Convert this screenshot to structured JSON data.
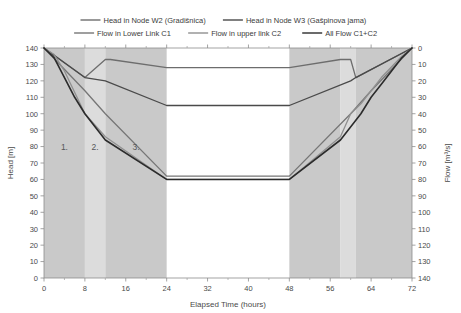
{
  "chart_data": {
    "type": "line",
    "title": "",
    "xlabel": "Elapsed Time (hours)",
    "ylabel_left": "Head [m]",
    "ylabel_right": "Flow [m³/s]",
    "xlim": [
      0,
      72
    ],
    "ylim_left": [
      0,
      140
    ],
    "ylim_right": [
      0,
      140
    ],
    "right_axis_inverted": true,
    "xticks": [
      0,
      8,
      16,
      24,
      32,
      40,
      48,
      56,
      64,
      72
    ],
    "yticks_left": [
      0,
      10,
      20,
      30,
      40,
      50,
      60,
      70,
      80,
      90,
      100,
      110,
      120,
      130,
      140
    ],
    "yticks_right": [
      0,
      10,
      20,
      30,
      40,
      50,
      60,
      70,
      80,
      90,
      100,
      110,
      120,
      130,
      140
    ],
    "grid": false,
    "legend_position": "top-center",
    "legend": [
      {
        "label": "Head in Node W2 (Gradišnica)",
        "color": "#6d6d6d",
        "axis": "left"
      },
      {
        "label": "Head in Node W3 (Gašpinova jama)",
        "color": "#4a4a4a",
        "axis": "left"
      },
      {
        "label": "Flow in Lower Link C1",
        "color": "#767676",
        "axis": "right"
      },
      {
        "label": "Flow in upper link C2",
        "color": "#909090",
        "axis": "right"
      },
      {
        "label": "All Flow C1+C2",
        "color": "#2b2b2b",
        "axis": "right"
      }
    ],
    "shaded_zones": [
      {
        "label": "1.",
        "x_start": 0,
        "x_end": 8,
        "color": "#c9c9c9"
      },
      {
        "label": "2.",
        "x_start": 8,
        "x_end": 12,
        "color": "#dcdcdc"
      },
      {
        "label": "3.",
        "x_start": 12,
        "x_end": 24,
        "color": "#c9c9c9"
      },
      {
        "label": "",
        "x_start": 48,
        "x_end": 58,
        "color": "#c9c9c9"
      },
      {
        "label": "",
        "x_start": 58,
        "x_end": 61,
        "color": "#dcdcdc"
      },
      {
        "label": "",
        "x_start": 61,
        "x_end": 72,
        "color": "#c9c9c9"
      }
    ],
    "zone_label_y": 78,
    "series": [
      {
        "name": "Head in Node W2 (Gradišnica)",
        "color": "#6d6d6d",
        "axis": "left",
        "width": 1.3,
        "x": [
          0,
          8,
          12,
          13,
          24,
          48,
          58,
          60,
          61,
          72
        ],
        "y": [
          140,
          122,
          133,
          133,
          128,
          128,
          133,
          133,
          122,
          140
        ]
      },
      {
        "name": "Head in Node W3 (Gašpinova jama)",
        "color": "#4a4a4a",
        "axis": "left",
        "width": 1.3,
        "x": [
          0,
          8,
          12,
          24,
          48,
          60,
          61,
          72
        ],
        "y": [
          140,
          122,
          120,
          105,
          105,
          120,
          122,
          140
        ]
      },
      {
        "name": "Flow in Lower Link C1",
        "color": "#767676",
        "axis": "right",
        "width": 1.3,
        "x": [
          0,
          8,
          12,
          24,
          48,
          60,
          64,
          72
        ],
        "y": [
          0,
          26,
          40,
          78,
          78,
          40,
          26,
          0
        ]
      },
      {
        "name": "Flow in upper link C2",
        "color": "#909090",
        "axis": "right",
        "width": 1.3,
        "x": [
          0,
          2,
          4,
          8,
          12,
          24,
          48,
          58,
          60,
          62,
          66,
          70,
          72
        ],
        "y": [
          0,
          4,
          14,
          40,
          54,
          80,
          80,
          54,
          40,
          34,
          18,
          5,
          0
        ]
      },
      {
        "name": "All Flow C1+C2",
        "color": "#2b2b2b",
        "axis": "right",
        "width": 1.6,
        "x": [
          0,
          2,
          4,
          6,
          8,
          12,
          24,
          48,
          58,
          62,
          64,
          66,
          68,
          70,
          72
        ],
        "y": [
          0,
          6,
          18,
          30,
          40,
          56,
          80,
          80,
          56,
          40,
          30,
          22,
          14,
          6,
          0
        ]
      }
    ]
  }
}
